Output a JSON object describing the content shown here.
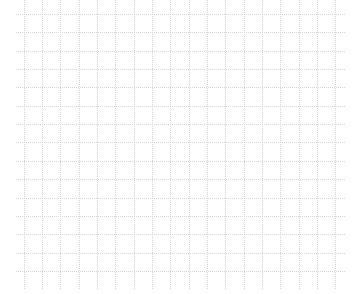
{
  "grid": {
    "background": "#ffffff",
    "line_color": "#d4d4d4",
    "x_start": 23.5,
    "y_start": 14,
    "spacing": 18.35,
    "columns": 18,
    "rows": 15,
    "extent": {
      "left": 16,
      "right": 345,
      "top": 0,
      "bottom": 290
    }
  }
}
